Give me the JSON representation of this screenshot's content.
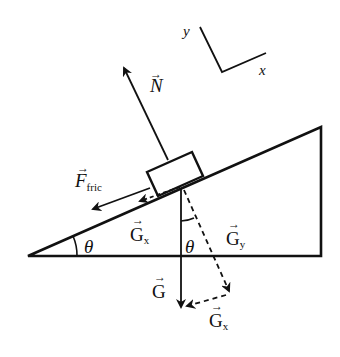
{
  "figure": {
    "axes": {
      "x_label": "x",
      "y_label": "y"
    },
    "labels": {
      "normal": "N",
      "friction_main": "F",
      "friction_sub": "fric",
      "gravity": "G",
      "gx_main": "G",
      "gx_sub": "x",
      "gy_main": "G",
      "gy_sub": "y",
      "gx2_main": "G",
      "gx2_sub": "x",
      "theta_incline": "θ",
      "theta_gravity": "θ",
      "vector_arrow": "→"
    },
    "colors": {
      "ink": "#111111",
      "background": "#ffffff"
    }
  }
}
